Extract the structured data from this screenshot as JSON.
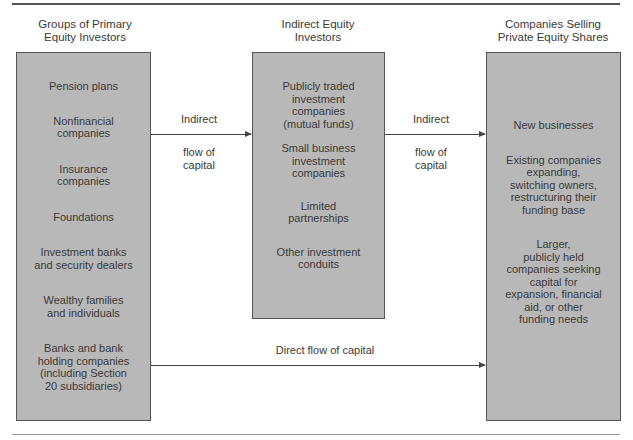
{
  "diagram": {
    "columns": [
      {
        "title": [
          "Groups of Primary",
          "Equity Investors"
        ],
        "items": [
          [
            "Pension plans"
          ],
          [
            "Nonfinancial",
            "companies"
          ],
          [
            "Insurance",
            "companies"
          ],
          [
            "Foundations"
          ],
          [
            "Investment banks",
            "and security dealers"
          ],
          [
            "Wealthy families",
            "and individuals"
          ],
          [
            "Banks and bank",
            "holding companies",
            "(including Section",
            "20 subsidiaries)"
          ]
        ]
      },
      {
        "title": [
          "Indirect Equity",
          "Investors"
        ],
        "items": [
          [
            "Publicly traded",
            "investment",
            "companies",
            "(mutual funds)"
          ],
          [
            "Small business",
            "investment",
            "companies"
          ],
          [
            "Limited",
            "partnerships"
          ],
          [
            "Other investment",
            "conduits"
          ]
        ]
      },
      {
        "title": [
          "Companies Selling",
          "Private Equity Shares"
        ],
        "items": [
          [
            "New businesses"
          ],
          [
            "Existing companies",
            "expanding,",
            "switching owners,",
            "restructuring their",
            "funding base"
          ],
          [
            "Larger,",
            "publicly held",
            "companies seeking",
            "capital for",
            "expansion, financial",
            "aid, or other",
            "funding needs"
          ]
        ]
      }
    ],
    "arrows": [
      {
        "from": "Groups of Primary Equity Investors",
        "to": "Indirect Equity Investors",
        "label_above": "Indirect",
        "label_below": [
          "flow of",
          "capital"
        ]
      },
      {
        "from": "Indirect Equity Investors",
        "to": "Companies Selling Private Equity Shares",
        "label_above": "Indirect",
        "label_below": [
          "flow of",
          "capital"
        ]
      },
      {
        "from": "Groups of Primary Equity Investors",
        "to": "Companies Selling Private Equity Shares",
        "label_above": "Direct flow of capital"
      }
    ],
    "colors": {
      "box_fill": "#b8b8b8",
      "box_border": "#555555",
      "text": "#3a3a3a",
      "arrow": "#444444"
    }
  }
}
